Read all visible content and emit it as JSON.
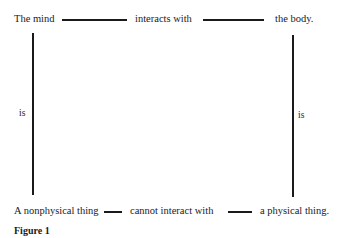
{
  "diagram": {
    "top_row": {
      "subject": "The mind",
      "relation": "interacts with",
      "object": "the body."
    },
    "left_column": {
      "relation": "is"
    },
    "right_column": {
      "relation": "is"
    },
    "bottom_row": {
      "subject": "A nonphysical thing",
      "relation": "cannot interact with",
      "object": "a physical thing."
    },
    "caption": "Figure 1"
  }
}
